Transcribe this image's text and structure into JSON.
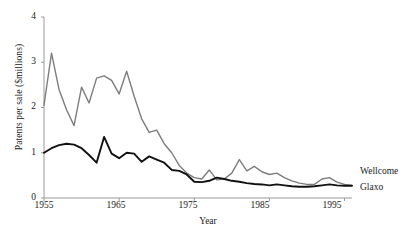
{
  "chart_data": {
    "type": "line",
    "title": "",
    "xlabel": "Year",
    "ylabel": "Patents per sale ($millions)",
    "xlim": [
      1955,
      1996
    ],
    "ylim": [
      0,
      4
    ],
    "yticks": [
      0,
      1,
      2,
      3,
      4
    ],
    "xticks": [
      1955,
      1965,
      1975,
      1985,
      1995
    ],
    "grid": false,
    "legend_position": "right-inline",
    "x": [
      1955,
      1956,
      1957,
      1958,
      1959,
      1960,
      1961,
      1962,
      1963,
      1964,
      1965,
      1966,
      1967,
      1968,
      1969,
      1970,
      1971,
      1972,
      1973,
      1974,
      1975,
      1976,
      1977,
      1978,
      1979,
      1980,
      1981,
      1982,
      1983,
      1984,
      1985,
      1986,
      1987,
      1988,
      1989,
      1990,
      1991,
      1992,
      1993,
      1994,
      1995,
      1996
    ],
    "series": [
      {
        "name": "Wellcome",
        "color": "#7d7d7d",
        "values": [
          2.05,
          3.2,
          2.4,
          1.95,
          1.6,
          2.45,
          2.1,
          2.65,
          2.7,
          2.6,
          2.3,
          2.8,
          2.25,
          1.75,
          1.45,
          1.5,
          1.2,
          1.0,
          0.72,
          0.55,
          0.45,
          0.42,
          0.62,
          0.4,
          0.42,
          0.55,
          0.85,
          0.6,
          0.7,
          0.58,
          0.52,
          0.55,
          0.45,
          0.38,
          0.33,
          0.3,
          0.3,
          0.42,
          0.45,
          0.35,
          0.3,
          0.28
        ]
      },
      {
        "name": "Glaxo",
        "color": "#111111",
        "values": [
          1.0,
          1.1,
          1.17,
          1.2,
          1.18,
          1.1,
          0.95,
          0.78,
          1.35,
          0.98,
          0.88,
          1.0,
          0.98,
          0.8,
          0.92,
          0.85,
          0.78,
          0.62,
          0.6,
          0.52,
          0.36,
          0.35,
          0.38,
          0.45,
          0.42,
          0.38,
          0.36,
          0.33,
          0.31,
          0.3,
          0.28,
          0.3,
          0.28,
          0.26,
          0.25,
          0.25,
          0.26,
          0.28,
          0.3,
          0.28,
          0.27,
          0.27
        ]
      }
    ]
  },
  "labels": {
    "wellcome": "Wellcome",
    "glaxo": "Glaxo"
  },
  "axis": {
    "y_title": "Patents per sale ($millions)",
    "x_title": "Year",
    "y_tick_0": "0",
    "y_tick_1": "1",
    "y_tick_2": "2",
    "y_tick_3": "3",
    "y_tick_4": "4",
    "x_tick_0": "1955",
    "x_tick_1": "1965",
    "x_tick_2": "1975",
    "x_tick_3": "1985",
    "x_tick_4": "1995"
  }
}
